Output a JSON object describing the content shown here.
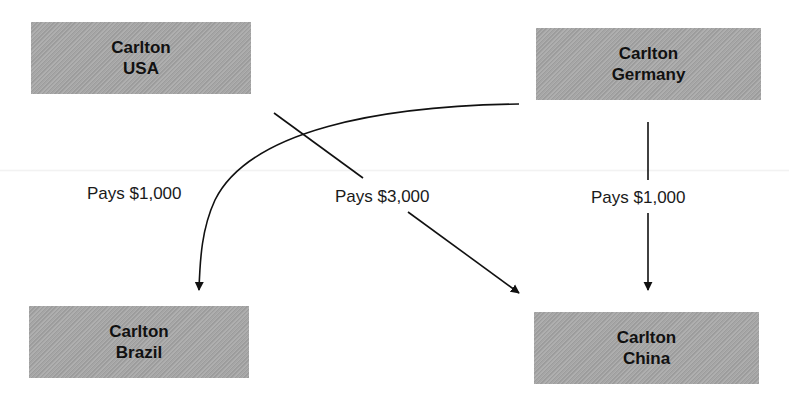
{
  "diagram": {
    "entities": [
      {
        "id": "usa",
        "line1": "Carlton",
        "line2": "USA"
      },
      {
        "id": "germany",
        "line1": "Carlton",
        "line2": "Germany"
      },
      {
        "id": "brazil",
        "line1": "Carlton",
        "line2": "Brazil"
      },
      {
        "id": "china",
        "line1": "Carlton",
        "line2": "China"
      }
    ],
    "flows": [
      {
        "from": "germany",
        "to": "brazil",
        "label": "Pays $1,000"
      },
      {
        "from": "usa",
        "to": "china",
        "label": "Pays $3,000"
      },
      {
        "from": "germany",
        "to": "china",
        "label": "Pays $1,000"
      }
    ],
    "colors": {
      "box_fill": "#a6a6a6",
      "line": "#111111",
      "text": "#111111"
    }
  }
}
